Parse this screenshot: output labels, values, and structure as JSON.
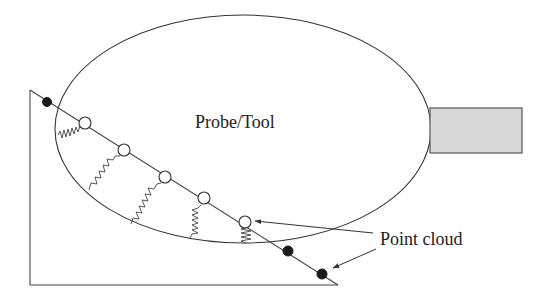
{
  "labels": {
    "probe": "Probe/Tool",
    "point_cloud": "Point cloud"
  },
  "colors": {
    "stroke": "#333333",
    "handle_fill": "#d9d9d9",
    "filled_point": "#1a1a1a",
    "background": "#ffffff"
  },
  "elements": {
    "probe_ellipse": {
      "cx": 243,
      "cy": 129,
      "rx": 188,
      "ry": 114
    },
    "handle_rect": {
      "x": 430,
      "y": 108,
      "width": 92,
      "height": 45
    },
    "wedge": {
      "top": [
        30,
        90
      ],
      "corner": [
        30,
        285
      ],
      "tip": [
        338,
        285
      ]
    },
    "filled_points": [
      [
        47,
        102
      ],
      [
        288,
        251
      ],
      [
        322,
        274
      ]
    ],
    "open_points": [
      [
        85,
        123
      ],
      [
        124,
        150
      ],
      [
        165,
        177
      ],
      [
        204,
        198
      ],
      [
        245,
        222
      ]
    ],
    "springs": [
      {
        "from": [
          58,
          135
        ],
        "to": [
          80,
          126
        ]
      },
      {
        "from": [
          89,
          190
        ],
        "to": [
          120,
          156
        ]
      },
      {
        "from": [
          131,
          224
        ],
        "to": [
          161,
          183
        ]
      },
      {
        "from": [
          190,
          238
        ],
        "to": [
          201,
          205
        ]
      },
      {
        "from": [
          246,
          243
        ],
        "to": [
          246,
          228
        ]
      }
    ],
    "arrows": [
      {
        "from": [
          373,
          233
        ],
        "to": [
          255,
          221
        ]
      },
      {
        "from": [
          376,
          249
        ],
        "to": [
          333,
          268
        ]
      }
    ]
  }
}
